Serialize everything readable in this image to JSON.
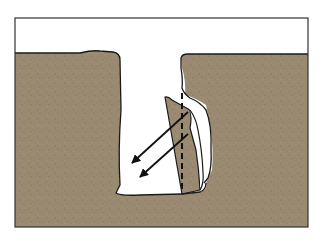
{
  "diagram": {
    "type": "geologic-cross-section",
    "colors": {
      "background": "#ffffff",
      "sky": "#ffffff",
      "soil": "#9a8a72",
      "soil_speckle_dark": "#7d6e58",
      "soil_speckle_light": "#b3a48c",
      "outline": "#1a1a1a",
      "opening": "#ffffff"
    },
    "elements": [
      {
        "name": "frame",
        "label": ""
      },
      {
        "name": "ground-left",
        "label": ""
      },
      {
        "name": "ground-right",
        "label": ""
      },
      {
        "name": "fissure-opening",
        "label": ""
      },
      {
        "name": "tilting-wedge-block",
        "label": ""
      },
      {
        "name": "separation-crack",
        "label": ""
      },
      {
        "name": "original-position-dashed-line",
        "label": ""
      },
      {
        "name": "movement-arrow-1",
        "direction": "down-left"
      },
      {
        "name": "movement-arrow-2",
        "direction": "down-left"
      }
    ]
  }
}
